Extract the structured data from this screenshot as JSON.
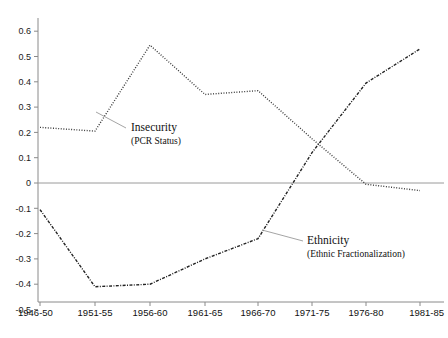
{
  "chart_data": {
    "type": "line",
    "title": "",
    "subtitle": "",
    "xlabel": "",
    "ylabel": "",
    "categories": [
      "1946-50",
      "1951-55",
      "1956-60",
      "1961-65",
      "1966-70",
      "1971-75",
      "1976-80",
      "1981-85"
    ],
    "ylim": [
      -0.5,
      0.65
    ],
    "yticks": [
      "0.6",
      "0.5",
      "0.4",
      "0.3",
      "0.2",
      "0.1",
      "0",
      "-0.1",
      "-0.2",
      "-0.3",
      "-0.4",
      "-0.5"
    ],
    "ytick_values": [
      0.6,
      0.5,
      0.4,
      0.3,
      0.2,
      0.1,
      0.0,
      -0.1,
      -0.2,
      -0.3,
      -0.4,
      -0.5
    ],
    "grid": false,
    "legend_position": "inline-annotations",
    "zero_line": 0,
    "series": [
      {
        "name": "Insecurity",
        "sublabel": "(PCR Status)",
        "style": "dotted",
        "color": "#3a3a3a",
        "values": [
          0.22,
          0.205,
          0.545,
          0.35,
          0.365,
          0.175,
          -0.005,
          -0.03
        ]
      },
      {
        "name": "Ethnicity",
        "sublabel": "(Ethnic Fractionalization)",
        "style": "dash-dot",
        "color": "#222222",
        "values": [
          -0.105,
          -0.41,
          -0.4,
          -0.3,
          -0.22,
          0.12,
          0.395,
          0.53
        ]
      }
    ],
    "annotations": [
      {
        "label": "Insecurity",
        "sublabel": "(PCR Status)",
        "text_x": 131,
        "text_y": 131,
        "leader_from_x": 126,
        "leader_from_y": 128,
        "leader_to_x": 96,
        "leader_to_y": 112
      },
      {
        "label": "Ethnicity",
        "sublabel": "(Ethnic Fractionalization)",
        "text_x": 307,
        "text_y": 244,
        "leader_from_x": 303,
        "leader_from_y": 241,
        "leader_to_x": 262,
        "leader_to_y": 230
      }
    ]
  },
  "axis": {
    "axis_color": "#8a8a8a",
    "zero_line_color": "#9a9a9a",
    "tick_color": "#8a8a8a"
  }
}
